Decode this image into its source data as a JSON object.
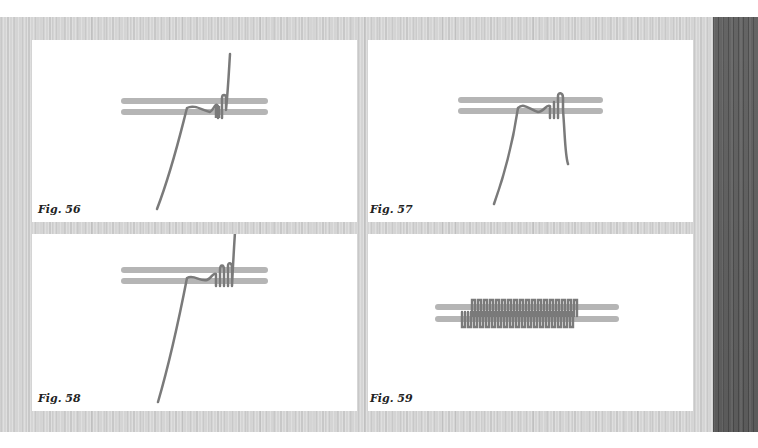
{
  "page": {
    "background": {
      "light_wood": "#d4d4d4",
      "dark_wood": "#6a6a6a"
    },
    "colors": {
      "rod": "#b5b5b5",
      "wire": "#7a7a7a",
      "panel": "#ffffff",
      "label": "#222222"
    }
  },
  "figures": [
    {
      "id": "fig-56",
      "label": "Fig. 56",
      "description": "wire wrapped twice around the two rods, long tail going up"
    },
    {
      "id": "fig-57",
      "label": "Fig. 57",
      "description": "wire passed under rods, second end hanging down"
    },
    {
      "id": "fig-58",
      "label": "Fig. 58",
      "description": "wire wrapped several times, tail going up"
    },
    {
      "id": "fig-59",
      "label": "Fig. 59",
      "description": "completed coil wrapping along both rods"
    }
  ]
}
